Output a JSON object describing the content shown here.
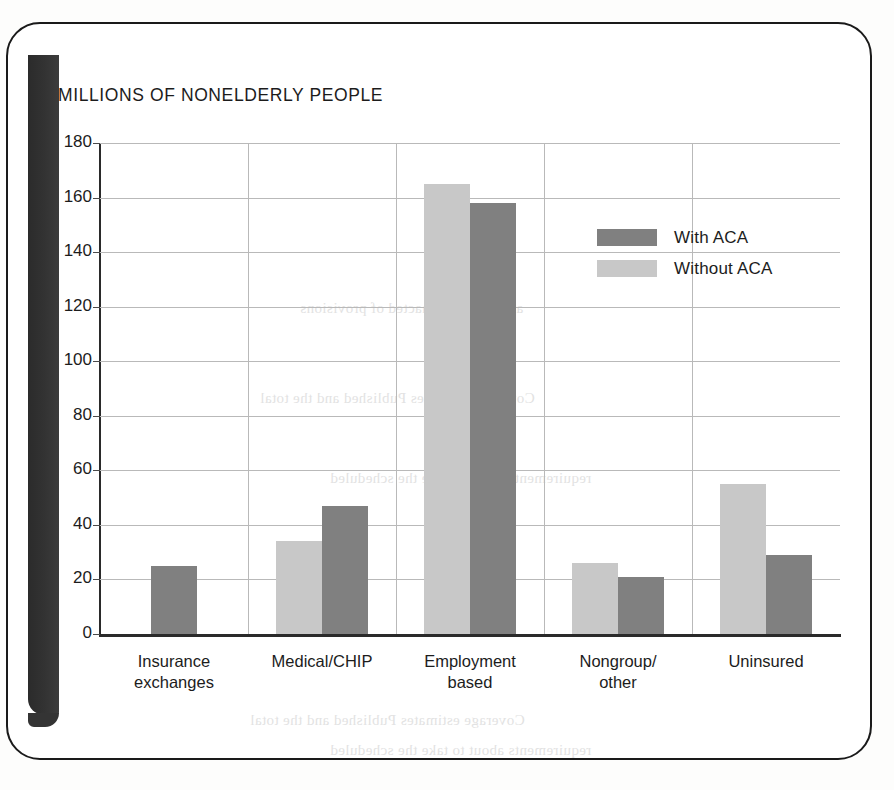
{
  "chart_data": {
    "type": "bar",
    "title": "MILLIONS OF NONELDERLY PEOPLE",
    "xlabel": "",
    "ylabel": "",
    "ylim": [
      0,
      180
    ],
    "ytick_step": 20,
    "yticks": [
      180,
      160,
      140,
      120,
      100,
      80,
      60,
      40,
      20,
      0
    ],
    "grid": "horizontal-and-vertical",
    "legend_position": "upper-right-inside",
    "categories": [
      "Insurance exchanges",
      "Medical/CHIP",
      "Employment based",
      "Nongroup/ other",
      "Uninsured"
    ],
    "category_lines": [
      [
        "Insurance",
        "exchanges"
      ],
      [
        "Medical/CHIP",
        ""
      ],
      [
        "Employment",
        "based"
      ],
      [
        "Nongroup/",
        "other"
      ],
      [
        "Uninsured",
        ""
      ]
    ],
    "series": [
      {
        "name": "Without ACA",
        "color": "#c8c8c8",
        "values": [
          null,
          34,
          165,
          26,
          55
        ]
      },
      {
        "name": "With ACA",
        "color": "#808080",
        "values": [
          25,
          47,
          158,
          21,
          29
        ]
      }
    ]
  },
  "legend": {
    "items": [
      {
        "label": "With ACA",
        "color": "#808080"
      },
      {
        "label": "Without ACA",
        "color": "#c8c8c8"
      }
    ]
  },
  "colors": {
    "with_aca": "#808080",
    "without_aca": "#c8c8c8",
    "axis": "#2a2a2a",
    "gridline": "#b9b9b9",
    "text": "#1c1c1c",
    "page_border": "#1a1a1a",
    "spine_shadow": "#333333"
  },
  "scan_artifacts": {
    "bleed_through_lines": [
      "and the 2010 enacted of provisions",
      "Coverage estimates  Published and the total",
      "requirements  about  to take  the scheduled"
    ]
  }
}
